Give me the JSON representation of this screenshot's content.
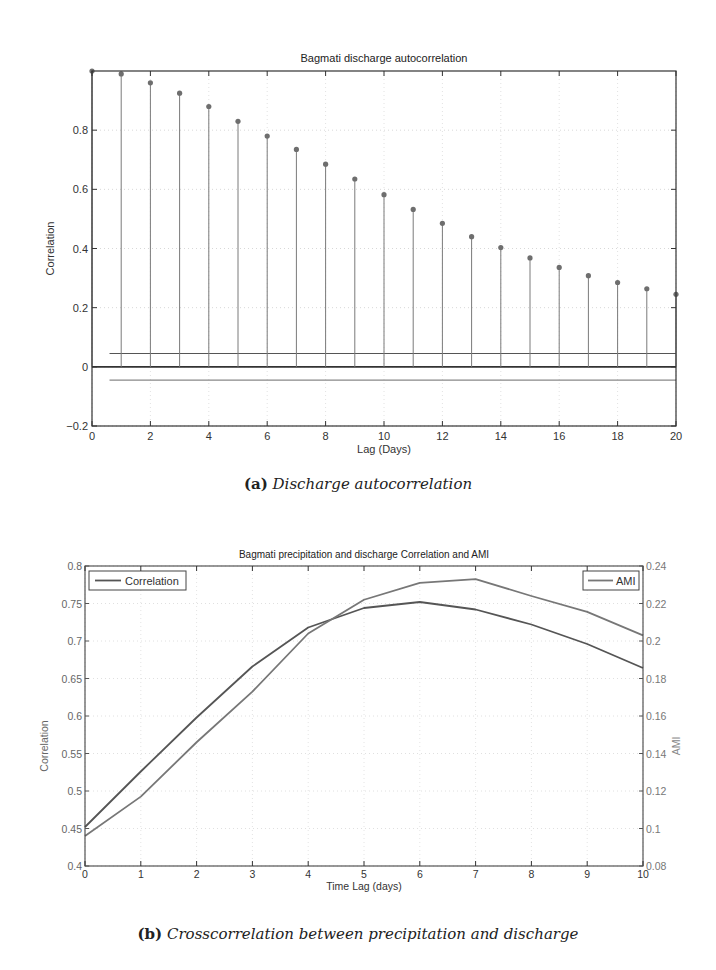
{
  "figures": [
    {
      "id": "a",
      "caption_tag": "(a)",
      "caption_text": "Discharge autocorrelation"
    },
    {
      "id": "b",
      "caption_tag": "(b)",
      "caption_text": "Crosscorrelation between precipitation and discharge"
    }
  ],
  "chart_data": [
    {
      "type": "stem",
      "title": "Bagmati discharge autocorrelation",
      "xlabel": "Lag (Days)",
      "ylabel": "Correlation",
      "xlim": [
        0,
        20
      ],
      "ylim": [
        -0.2,
        1.0
      ],
      "xticks": [
        0,
        2,
        4,
        6,
        8,
        10,
        12,
        14,
        16,
        18,
        20
      ],
      "yticks": [
        -0.2,
        0,
        0.2,
        0.4,
        0.6,
        0.8
      ],
      "grid": true,
      "x": [
        0,
        1,
        2,
        3,
        4,
        5,
        6,
        7,
        8,
        9,
        10,
        11,
        12,
        13,
        14,
        15,
        16,
        17,
        18,
        19,
        20
      ],
      "values": [
        1.0,
        0.99,
        0.96,
        0.925,
        0.88,
        0.83,
        0.78,
        0.735,
        0.685,
        0.635,
        0.582,
        0.532,
        0.485,
        0.44,
        0.403,
        0.368,
        0.336,
        0.308,
        0.285,
        0.264,
        0.245
      ],
      "confidence_bounds": [
        0.045,
        -0.045
      ],
      "colors": {
        "stem": "#7a7a7a",
        "marker": "#6e6e6e",
        "axis": "#333333",
        "bounds": "#555555"
      }
    },
    {
      "type": "line",
      "title": "Bagmati precipitation and discharge Correlation and AMI",
      "xlabel": "Time Lag (days)",
      "ylabel_left": "Correlation",
      "ylabel_right": "AMI",
      "x": [
        0,
        1,
        2,
        3,
        4,
        5,
        6,
        7,
        8,
        9,
        10
      ],
      "xlim": [
        0,
        10
      ],
      "ylim_left": [
        0.4,
        0.8
      ],
      "ylim_right": [
        0.08,
        0.24
      ],
      "xticks": [
        0,
        1,
        2,
        3,
        4,
        5,
        6,
        7,
        8,
        9,
        10
      ],
      "yticks_left": [
        0.4,
        0.45,
        0.5,
        0.55,
        0.6,
        0.65,
        0.7,
        0.75,
        0.8
      ],
      "yticks_left_labels": [
        "0.4",
        "0.45",
        "0.5",
        "0.55",
        "0.6",
        "0.65",
        "0.7",
        "0.75",
        "0.8"
      ],
      "yticks_right": [
        0.08,
        0.1,
        0.12,
        0.14,
        0.16,
        0.18,
        0.2,
        0.22,
        0.24
      ],
      "yticks_right_labels": [
        "0.08",
        "0.1",
        "0.12",
        "0.14",
        "0.16",
        "0.18",
        "0.2",
        "0.22",
        "0.24"
      ],
      "grid": true,
      "series": [
        {
          "name": "Correlation",
          "axis": "left",
          "values": [
            0.452,
            0.526,
            0.598,
            0.666,
            0.718,
            0.744,
            0.752,
            0.742,
            0.722,
            0.696,
            0.664
          ],
          "color": "#555555"
        },
        {
          "name": "AMI",
          "axis": "right",
          "values": [
            0.096,
            0.117,
            0.146,
            0.173,
            0.204,
            0.222,
            0.231,
            0.233,
            0.224,
            0.2155,
            0.203
          ],
          "color": "#777777"
        }
      ],
      "legends": [
        {
          "label": "Correlation",
          "position": "top-left"
        },
        {
          "label": "AMI",
          "position": "top-right"
        }
      ]
    }
  ]
}
